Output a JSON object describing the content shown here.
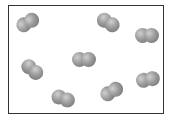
{
  "diagram": {
    "molecule_color": "#8f8f8f",
    "molecules": [
      {
        "x": 16,
        "y": 15,
        "angle": -30
      },
      {
        "x": 96,
        "y": 15,
        "angle": 30
      },
      {
        "x": 135,
        "y": 28,
        "angle": 0
      },
      {
        "x": 72,
        "y": 52,
        "angle": 0
      },
      {
        "x": 20,
        "y": 62,
        "angle": 40
      },
      {
        "x": 136,
        "y": 72,
        "angle": -10
      },
      {
        "x": 100,
        "y": 84,
        "angle": -30
      },
      {
        "x": 51,
        "y": 91,
        "angle": 20
      }
    ]
  }
}
